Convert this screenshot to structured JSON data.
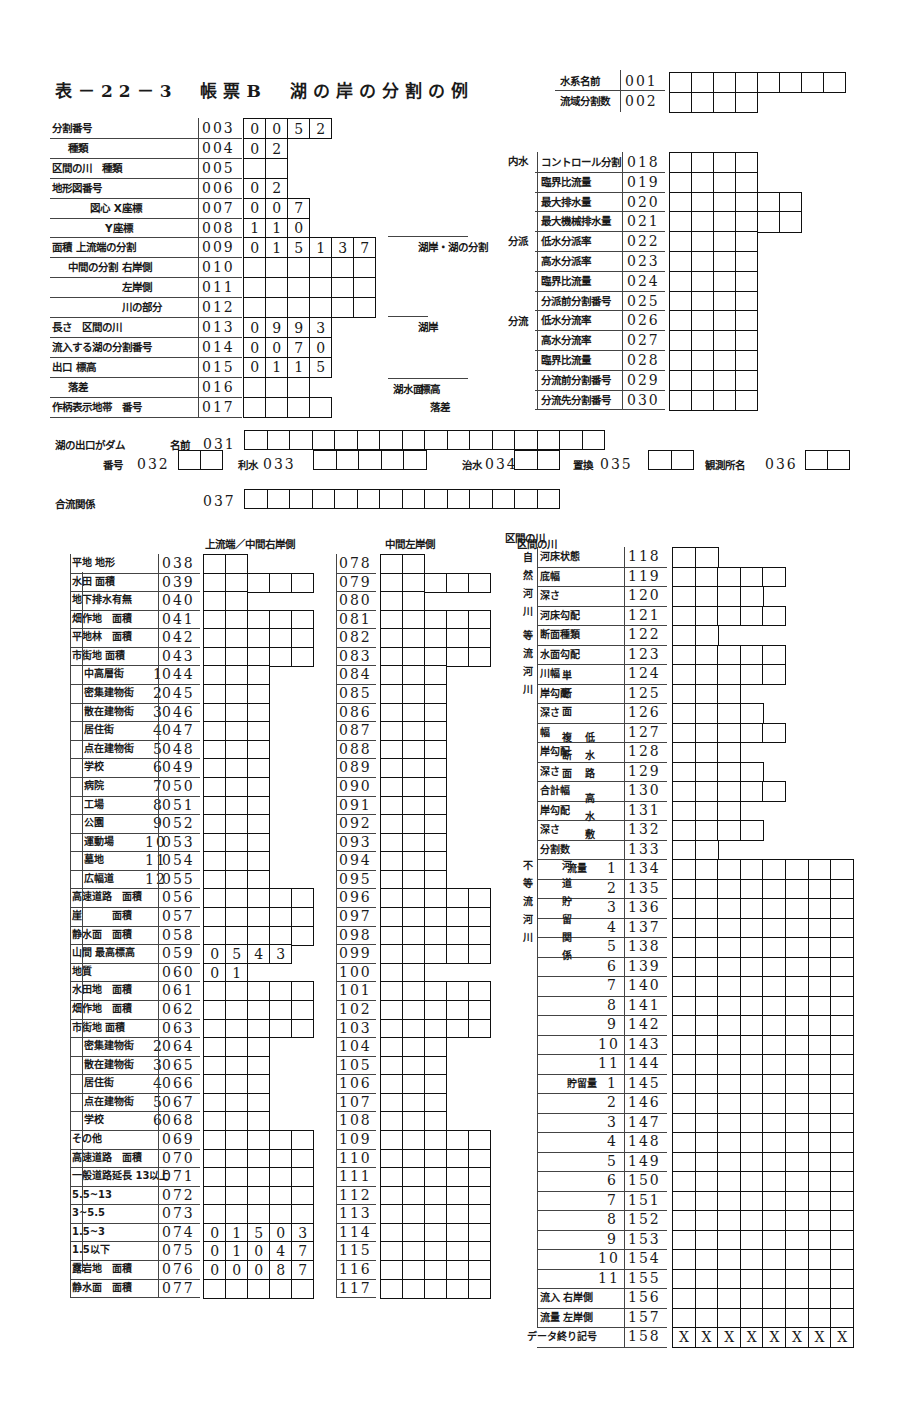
{
  "title": "表－22－3　帳票B　湖の岸の分割の例",
  "header_fields": [
    {
      "label": "水系名前",
      "code": "001",
      "boxes": 8,
      "values": []
    },
    {
      "label": "流域分割数",
      "code": "002",
      "boxes": 4,
      "values": []
    }
  ],
  "left_top": [
    {
      "label": "分割番号",
      "code": "003",
      "boxes": 4,
      "values": [
        "0",
        "0",
        "5",
        "2"
      ]
    },
    {
      "label": "種類",
      "code": "004",
      "boxes": 2,
      "values": [
        "0",
        "2"
      ]
    },
    {
      "label": "区間の川　種類",
      "code": "005",
      "boxes": 2,
      "values": []
    },
    {
      "label": "地形図番号",
      "code": "006",
      "boxes": 2,
      "values": [
        "0",
        "2"
      ]
    },
    {
      "label": "図心 X座標",
      "code": "007",
      "boxes": 3,
      "values": [
        "0",
        "0",
        "7"
      ]
    },
    {
      "label": "Y座標",
      "code": "008",
      "boxes": 3,
      "values": [
        "1",
        "1",
        "0"
      ]
    },
    {
      "label": "面積 上流端の分割",
      "code": "009",
      "boxes": 6,
      "values": [
        "0",
        "1",
        "5",
        "1",
        "3",
        "7"
      ]
    },
    {
      "label": "中間の分割 右岸側",
      "code": "010",
      "boxes": 6,
      "values": []
    },
    {
      "label": "左岸側",
      "code": "011",
      "boxes": 6,
      "values": []
    },
    {
      "label": "川の部分",
      "code": "012",
      "boxes": 6,
      "values": []
    },
    {
      "label": "長さ　区間の川",
      "code": "013",
      "boxes": 4,
      "values": [
        "0",
        "9",
        "9",
        "3"
      ]
    },
    {
      "label": "流入する湖の分割番号",
      "code": "014",
      "boxes": 4,
      "values": [
        "0",
        "0",
        "7",
        "0"
      ]
    },
    {
      "label": "出口 標高",
      "code": "015",
      "boxes": 4,
      "values": [
        "0",
        "1",
        "1",
        "5"
      ]
    },
    {
      "label": "落差",
      "code": "016",
      "boxes": 3,
      "values": []
    },
    {
      "label": "作柄表示地帯　番号",
      "code": "017",
      "boxes": 4,
      "values": []
    }
  ],
  "side_notes": {
    "n1": "湖岸・湖の分割",
    "n2": "湖岸",
    "n3": "湖水面",
    "n3a": "標高",
    "n3b": "落差"
  },
  "right_top_groups": {
    "g1": "内水",
    "g2": "分派",
    "g3": "分流"
  },
  "right_top": [
    {
      "label": "コントロール分割",
      "code": "018",
      "boxes": 4
    },
    {
      "label": "臨界比流量",
      "code": "019",
      "boxes": 4
    },
    {
      "label": "最大排水量",
      "code": "020",
      "boxes": 6
    },
    {
      "label": "最大機械排水量",
      "code": "021",
      "boxes": 6
    },
    {
      "label": "低水分派率",
      "code": "022",
      "boxes": 4
    },
    {
      "label": "高水分派率",
      "code": "023",
      "boxes": 4
    },
    {
      "label": "臨界比流量",
      "code": "024",
      "boxes": 4
    },
    {
      "label": "分派前分割番号",
      "code": "025",
      "boxes": 4
    },
    {
      "label": "低水分流率",
      "code": "026",
      "boxes": 4
    },
    {
      "label": "高水分流率",
      "code": "027",
      "boxes": 4
    },
    {
      "label": "臨界比流量",
      "code": "028",
      "boxes": 4
    },
    {
      "label": "分流前分割番号",
      "code": "029",
      "boxes": 4
    },
    {
      "label": "分流先分割番号",
      "code": "030",
      "boxes": 4
    }
  ],
  "dam": {
    "label": "湖の出口がダム",
    "name_label": "名前",
    "name_code": "031",
    "name_boxes": 16,
    "number_label": "番号",
    "number_code": "032",
    "number_boxes": 2,
    "irrigation_label": "利水",
    "irrigation_code": "033",
    "irrigation_boxes": 5,
    "flood_label": "治水",
    "flood_code": "034",
    "flood_boxes": 2,
    "replace_label": "置換",
    "replace_code": "035",
    "replace_boxes": 2,
    "station_label": "観測所名",
    "station_code": "036",
    "station_boxes": 2
  },
  "confluence": {
    "label": "合流関係",
    "code": "037",
    "boxes": 14
  },
  "col_headers": {
    "left": "上流端／中間右岸側",
    "middle": "中間左岸側",
    "right": "区間の川"
  },
  "lower_left": [
    {
      "label": "平地 地形",
      "code": "038",
      "boxes": 2,
      "values": []
    },
    {
      "label": "水田 面積",
      "code": "039",
      "boxes": 5,
      "values": []
    },
    {
      "label": "地下排水有無",
      "code": "040",
      "boxes": 2,
      "values": []
    },
    {
      "label": "畑作地　面積",
      "code": "041",
      "boxes": 5,
      "values": []
    },
    {
      "label": "平地林　面積",
      "code": "042",
      "boxes": 5,
      "values": []
    },
    {
      "label": "市街地 面積",
      "code": "043",
      "boxes": 5,
      "values": []
    },
    {
      "label": "中高層街",
      "num": "1",
      "code": "044",
      "boxes": 3,
      "values": []
    },
    {
      "label": "密集建物街",
      "num": "2",
      "code": "045",
      "boxes": 3,
      "values": []
    },
    {
      "label": "散在建物街",
      "num": "3",
      "code": "046",
      "boxes": 3,
      "values": []
    },
    {
      "label": "居住街",
      "num": "4",
      "code": "047",
      "boxes": 3,
      "values": []
    },
    {
      "label": "点在建物街",
      "num": "5",
      "code": "048",
      "boxes": 3,
      "values": []
    },
    {
      "label": "学校",
      "num": "6",
      "code": "049",
      "boxes": 3,
      "values": []
    },
    {
      "label": "病院",
      "num": "7",
      "code": "050",
      "boxes": 3,
      "values": []
    },
    {
      "label": "工場",
      "num": "8",
      "code": "051",
      "boxes": 3,
      "values": []
    },
    {
      "label": "公園",
      "num": "9",
      "code": "052",
      "boxes": 3,
      "values": []
    },
    {
      "label": "運動場",
      "num": "10",
      "code": "053",
      "boxes": 3,
      "values": []
    },
    {
      "label": "墓地",
      "num": "11",
      "code": "054",
      "boxes": 3,
      "values": []
    },
    {
      "label": "広幅道",
      "num": "12",
      "code": "055",
      "boxes": 3,
      "values": []
    },
    {
      "label": "高速道路　面積",
      "code": "056",
      "boxes": 5,
      "values": []
    },
    {
      "label": "崖　　　面積",
      "code": "057",
      "boxes": 5,
      "values": []
    },
    {
      "label": "静水面　面積",
      "code": "058",
      "boxes": 5,
      "values": []
    },
    {
      "label": "山間 最高標高",
      "code": "059",
      "boxes": 4,
      "values": [
        "0",
        "5",
        "4",
        "3"
      ]
    },
    {
      "label": "地質",
      "code": "060",
      "boxes": 2,
      "values": [
        "0",
        "1"
      ]
    },
    {
      "label": "水田地　面積",
      "code": "061",
      "boxes": 5,
      "values": []
    },
    {
      "label": "畑作地　面積",
      "code": "062",
      "boxes": 5,
      "values": []
    },
    {
      "label": "市街地 面積",
      "code": "063",
      "boxes": 5,
      "values": []
    },
    {
      "label": "密集建物街",
      "num": "2",
      "code": "064",
      "boxes": 3,
      "values": []
    },
    {
      "label": "散在建物街",
      "num": "3",
      "code": "065",
      "boxes": 3,
      "values": []
    },
    {
      "label": "居住街",
      "num": "4",
      "code": "066",
      "boxes": 3,
      "values": []
    },
    {
      "label": "点在建物街",
      "num": "5",
      "code": "067",
      "boxes": 3,
      "values": []
    },
    {
      "label": "学校",
      "num": "6",
      "code": "068",
      "boxes": 3,
      "values": []
    },
    {
      "label": "その他",
      "code": "069",
      "boxes": 5,
      "values": []
    },
    {
      "label": "高速道路　面積",
      "code": "070",
      "boxes": 5,
      "values": []
    },
    {
      "label": "一般道路延長 13以上",
      "code": "071",
      "boxes": 5,
      "values": []
    },
    {
      "label": "5.5~13",
      "code": "072",
      "boxes": 5,
      "values": []
    },
    {
      "label": "3~5.5",
      "code": "073",
      "boxes": 5,
      "values": []
    },
    {
      "label": "1.5~3",
      "code": "074",
      "boxes": 5,
      "values": [
        "0",
        "1",
        "5",
        "0",
        "3"
      ]
    },
    {
      "label": "1.5以下",
      "code": "075",
      "boxes": 5,
      "values": [
        "0",
        "1",
        "0",
        "4",
        "7"
      ]
    },
    {
      "label": "露岩地　面積",
      "code": "076",
      "boxes": 5,
      "values": [
        "0",
        "0",
        "0",
        "8",
        "7"
      ]
    },
    {
      "label": "静水面　面積",
      "code": "077",
      "boxes": 5,
      "values": []
    }
  ],
  "middle_codes": [
    "078",
    "079",
    "080",
    "081",
    "082",
    "083",
    "084",
    "085",
    "086",
    "087",
    "088",
    "089",
    "090",
    "091",
    "092",
    "093",
    "094",
    "095",
    "096",
    "097",
    "098",
    "099",
    "100",
    "101",
    "102",
    "103",
    "104",
    "105",
    "106",
    "107",
    "108",
    "109",
    "110",
    "111",
    "112",
    "113",
    "114",
    "115",
    "116",
    "117"
  ],
  "lower_right": [
    {
      "label": "河床状態",
      "code": "118",
      "boxes": 2
    },
    {
      "label": "底幅",
      "code": "119",
      "boxes": 5
    },
    {
      "label": "深さ",
      "code": "120",
      "boxes": 4
    },
    {
      "label": "河床勾配",
      "code": "121",
      "boxes": 5
    },
    {
      "label": "断面種類",
      "code": "122",
      "boxes": 2
    },
    {
      "label": "水面勾配",
      "code": "123",
      "boxes": 5
    },
    {
      "label": "川幅",
      "code": "124",
      "boxes": 5
    },
    {
      "label": "岸勾配",
      "code": "125",
      "boxes": 3
    },
    {
      "label": "深さ",
      "code": "126",
      "boxes": 4
    },
    {
      "label": "幅",
      "code": "127",
      "boxes": 5
    },
    {
      "label": "岸勾配",
      "code": "128",
      "boxes": 3
    },
    {
      "label": "深さ",
      "code": "129",
      "boxes": 4
    },
    {
      "label": "合計幅",
      "code": "130",
      "boxes": 5
    },
    {
      "label": "岸勾配",
      "code": "131",
      "boxes": 3
    },
    {
      "label": "深さ",
      "code": "132",
      "boxes": 4
    },
    {
      "label": "分割数",
      "code": "133",
      "boxes": 2
    },
    {
      "label": "流量",
      "num": "1",
      "code": "134",
      "boxes": 8
    },
    {
      "num": "2",
      "code": "135",
      "boxes": 8
    },
    {
      "num": "3",
      "code": "136",
      "boxes": 8
    },
    {
      "num": "4",
      "code": "137",
      "boxes": 8
    },
    {
      "num": "5",
      "code": "138",
      "boxes": 8
    },
    {
      "num": "6",
      "code": "139",
      "boxes": 8
    },
    {
      "num": "7",
      "code": "140",
      "boxes": 8
    },
    {
      "num": "8",
      "code": "141",
      "boxes": 8
    },
    {
      "num": "9",
      "code": "142",
      "boxes": 8
    },
    {
      "num": "10",
      "code": "143",
      "boxes": 8
    },
    {
      "num": "11",
      "code": "144",
      "boxes": 8
    },
    {
      "label": "貯留量",
      "num": "1",
      "code": "145",
      "boxes": 8
    },
    {
      "num": "2",
      "code": "146",
      "boxes": 8
    },
    {
      "num": "3",
      "code": "147",
      "boxes": 8
    },
    {
      "num": "4",
      "code": "148",
      "boxes": 8
    },
    {
      "num": "5",
      "code": "149",
      "boxes": 8
    },
    {
      "num": "6",
      "code": "150",
      "boxes": 8
    },
    {
      "num": "7",
      "code": "151",
      "boxes": 8
    },
    {
      "num": "8",
      "code": "152",
      "boxes": 8
    },
    {
      "num": "9",
      "code": "153",
      "boxes": 8
    },
    {
      "num": "10",
      "code": "154",
      "boxes": 8
    },
    {
      "num": "11",
      "code": "155",
      "boxes": 8
    },
    {
      "label": "流入 右岸側",
      "code": "156",
      "boxes": 8
    },
    {
      "label": "流量 左岸側",
      "code": "157",
      "boxes": 8
    },
    {
      "label": "データ終り記号",
      "code": "158",
      "boxes": 8,
      "values": [
        "X",
        "X",
        "X",
        "X",
        "X",
        "X",
        "X",
        "X"
      ]
    }
  ],
  "right_groups": {
    "natural": "自然河川",
    "equal": "等流河川",
    "single": "単断面",
    "compound": "複断面",
    "low": "低水路",
    "high": "高水敷",
    "unequal": "不等流河川",
    "channel": "河道貯留関係"
  }
}
